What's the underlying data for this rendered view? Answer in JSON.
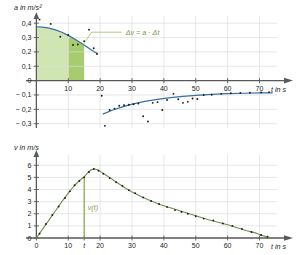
{
  "figure": {
    "background": "#ffffff",
    "grid_color": "#dcdde1",
    "axis_color": "#58595b",
    "point_color": "#1a1a1a"
  },
  "charts": [
    {
      "id": "acceleration-chart",
      "type": "scatter",
      "title": "",
      "ylabel": "a in m/s²",
      "xlabel": "t in s",
      "xlim": [
        -2,
        78
      ],
      "ylim": [
        -0.33,
        0.45
      ],
      "xticks": [
        10,
        20,
        30,
        40,
        50,
        60,
        70
      ],
      "xticklabels": [
        "10",
        "20",
        "30",
        "40",
        "50",
        "60",
        "70"
      ],
      "yticks": [
        0.4,
        0.3,
        0.2,
        0.1,
        0,
        -0.1,
        -0.2,
        -0.3
      ],
      "yticklabels": [
        "0,4",
        "0,3",
        "0,2",
        "0,1",
        "0",
        "− 0,1",
        "− 0,2",
        "− 0,3"
      ],
      "grid": true,
      "annotation": {
        "text": "Δv = a · Δt",
        "color": "#6f9b3f",
        "x": 28,
        "y": 0.33
      },
      "shaded_regions": [
        {
          "name": "area-light",
          "x_from": 0,
          "x_to": 10,
          "color": "#cfe6b2",
          "opacity": 1
        },
        {
          "name": "area-dark",
          "x_from": 10,
          "x_to": 15,
          "color": "#a7cc6f",
          "opacity": 1
        }
      ],
      "curves": [
        {
          "name": "a-positive-curve",
          "color": "#3b6ea5",
          "x": [
            0,
            2,
            4,
            6,
            8,
            10,
            12,
            14,
            16,
            18,
            19
          ],
          "y": [
            0.375,
            0.372,
            0.365,
            0.353,
            0.337,
            0.315,
            0.29,
            0.262,
            0.232,
            0.203,
            0.19
          ]
        },
        {
          "name": "a-negative-curve",
          "color": "#3b6ea5",
          "x": [
            21,
            24,
            27,
            30,
            34,
            38,
            42,
            46,
            50,
            55,
            60,
            65,
            70,
            74
          ],
          "y": [
            -0.232,
            -0.205,
            -0.183,
            -0.164,
            -0.145,
            -0.131,
            -0.119,
            -0.11,
            -0.103,
            -0.096,
            -0.091,
            -0.088,
            -0.086,
            -0.085
          ]
        }
      ],
      "series": [
        {
          "name": "measured-acceleration",
          "marker": "dot",
          "color": "#1a1a1a",
          "points": [
            [
              1.0,
              0.425
            ],
            [
              4.5,
              0.395
            ],
            [
              7.5,
              0.305
            ],
            [
              10.0,
              0.318
            ],
            [
              11.5,
              0.248
            ],
            [
              13.0,
              0.252
            ],
            [
              15.0,
              0.275
            ],
            [
              16.5,
              0.355
            ],
            [
              18.0,
              0.225
            ],
            [
              19.0,
              0.185
            ],
            [
              20.5,
              -0.105
            ],
            [
              21.5,
              -0.315
            ],
            [
              23.0,
              -0.205
            ],
            [
              24.5,
              -0.195
            ],
            [
              26.0,
              -0.175
            ],
            [
              27.5,
              -0.172
            ],
            [
              29.0,
              -0.168
            ],
            [
              30.5,
              -0.165
            ],
            [
              32.0,
              -0.16
            ],
            [
              33.5,
              -0.248
            ],
            [
              35.0,
              -0.285
            ],
            [
              36.5,
              -0.155
            ],
            [
              38.0,
              -0.15
            ],
            [
              39.5,
              -0.205
            ],
            [
              41.0,
              -0.135
            ],
            [
              43.0,
              -0.092
            ],
            [
              44.5,
              -0.13
            ],
            [
              46.0,
              -0.155
            ],
            [
              47.5,
              -0.148
            ],
            [
              49.0,
              -0.125
            ],
            [
              50.5,
              -0.128
            ],
            [
              52.5,
              -0.1
            ],
            [
              55.0,
              -0.098
            ],
            [
              58.0,
              -0.092
            ],
            [
              61.0,
              -0.088
            ],
            [
              64.0,
              -0.086
            ],
            [
              67.0,
              -0.085
            ],
            [
              70.5,
              -0.082
            ],
            [
              73.0,
              -0.08
            ]
          ]
        }
      ]
    },
    {
      "id": "velocity-chart",
      "type": "scatter",
      "title": "",
      "ylabel": "v in m/s",
      "xlabel": "t in s",
      "xlim": [
        -2,
        78
      ],
      "ylim": [
        0,
        6.6
      ],
      "xticks": [
        0,
        10,
        20,
        30,
        40,
        50,
        60,
        70
      ],
      "xticklabels": [
        "0",
        "10",
        "20",
        "30",
        "40",
        "50",
        "60",
        "70"
      ],
      "extra_xtick": {
        "value": 15,
        "label": "t"
      },
      "yticks": [
        0,
        1,
        2,
        3,
        4,
        5,
        6
      ],
      "yticklabels": [
        "0",
        "1",
        "2",
        "3",
        "4",
        "5",
        "6"
      ],
      "grid": true,
      "marker_line": {
        "name": "v-of-t-marker",
        "x": 15,
        "y_from": 0,
        "y_to": 5.0,
        "color": "#7aa544",
        "label": "v(t)"
      },
      "curves": [
        {
          "name": "v-curve",
          "color": "#6f8f4a",
          "x": [
            0,
            2,
            4,
            6,
            8,
            10,
            12,
            14,
            15,
            16,
            17,
            18,
            19,
            20,
            22,
            24,
            26,
            28,
            30,
            33,
            36,
            39,
            42,
            45,
            48,
            51,
            54,
            57,
            60,
            63,
            66,
            69,
            72,
            74
          ],
          "y": [
            0.0,
            0.75,
            1.5,
            2.25,
            3.0,
            3.7,
            4.35,
            4.85,
            5.05,
            5.35,
            5.6,
            5.7,
            5.65,
            5.5,
            5.15,
            4.8,
            4.45,
            4.1,
            3.8,
            3.4,
            3.05,
            2.75,
            2.5,
            2.25,
            2.0,
            1.75,
            1.5,
            1.3,
            1.1,
            0.85,
            0.6,
            0.4,
            0.1,
            0.0
          ]
        }
      ],
      "series": [
        {
          "name": "measured-velocity",
          "marker": "dot",
          "color": "#1a1a1a",
          "points": [
            [
              1.0,
              0.35
            ],
            [
              3.0,
              1.15
            ],
            [
              5.0,
              1.9
            ],
            [
              7.0,
              2.6
            ],
            [
              9.0,
              3.3
            ],
            [
              10.5,
              3.85
            ],
            [
              12.0,
              4.35
            ],
            [
              13.5,
              4.7
            ],
            [
              15.0,
              5.0
            ],
            [
              16.5,
              5.45
            ],
            [
              18.0,
              5.7
            ],
            [
              19.5,
              5.55
            ],
            [
              21.0,
              5.3
            ],
            [
              23.0,
              4.95
            ],
            [
              25.0,
              4.6
            ],
            [
              27.0,
              4.3
            ],
            [
              29.0,
              3.95
            ],
            [
              31.0,
              3.7
            ],
            [
              33.5,
              3.35
            ],
            [
              36.0,
              3.05
            ],
            [
              38.5,
              2.8
            ],
            [
              41.0,
              2.55
            ],
            [
              43.5,
              2.3
            ],
            [
              45.5,
              2.15
            ],
            [
              47.5,
              2.0
            ],
            [
              50.0,
              1.8
            ],
            [
              52.5,
              1.6
            ],
            [
              55.5,
              1.45
            ],
            [
              58.5,
              1.2
            ],
            [
              61.5,
              1.0
            ],
            [
              64.5,
              0.75
            ],
            [
              67.5,
              0.5
            ],
            [
              70.5,
              0.25
            ],
            [
              72.5,
              0.1
            ]
          ]
        }
      ]
    }
  ]
}
